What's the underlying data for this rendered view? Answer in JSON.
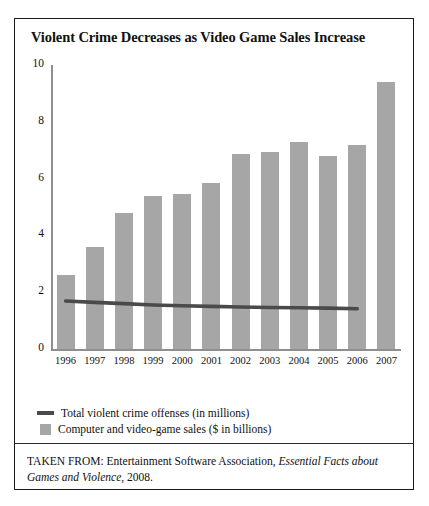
{
  "figure": {
    "title": "Violent Crime Decreases as Video Game Sales Increase",
    "source_prefix": "TAKEN FROM: Entertainment Software Association,",
    "source_italic": "Essential Facts about Games and Violence",
    "source_suffix": ", 2008."
  },
  "colors": {
    "bar": "#a6a6a6",
    "line": "#4a4a4a",
    "axis": "#8e8e8e",
    "border": "#1b1b1b",
    "text": "#111111"
  },
  "legend": {
    "line_label": "Total violent crime offenses (in millions)",
    "bar_label": "Computer and video-game sales ($ in billions)"
  },
  "chart_data": {
    "type": "bar",
    "title": "Violent Crime Decreases as Video Game Sales Increase",
    "xlabel": "",
    "ylabel": "",
    "ylim": [
      0,
      10
    ],
    "yticks": [
      "0",
      "2",
      "4",
      "6",
      "8",
      "10"
    ],
    "grid": false,
    "legend_position": "below-plot",
    "categories": [
      "1996",
      "1997",
      "1998",
      "1999",
      "2000",
      "2001",
      "2002",
      "2003",
      "2004",
      "2005",
      "2006",
      "2007"
    ],
    "series": [
      {
        "name": "Computer and video-game sales ($ in billions)",
        "type": "bar",
        "values": [
          2.6,
          3.6,
          4.8,
          5.4,
          5.45,
          5.85,
          6.85,
          6.95,
          7.3,
          6.8,
          7.2,
          9.4
        ]
      },
      {
        "name": "Total violent crime offenses (in millions)",
        "type": "line",
        "values": [
          1.69,
          1.64,
          1.6,
          1.55,
          1.52,
          1.5,
          1.48,
          1.46,
          1.45,
          1.44,
          1.42,
          null
        ]
      }
    ]
  }
}
